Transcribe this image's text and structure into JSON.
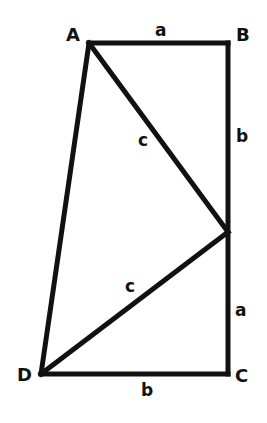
{
  "diagram": {
    "type": "geometry-figure",
    "colors": {
      "line": "#111111",
      "background": "#ffffff"
    },
    "vertices": {
      "A": {
        "label": "A",
        "x": 89,
        "y": 43
      },
      "B": {
        "label": "B",
        "x": 228,
        "y": 43
      },
      "E": {
        "label": "",
        "x": 228,
        "y": 232
      },
      "C": {
        "label": "C",
        "x": 228,
        "y": 374
      },
      "D": {
        "label": "D",
        "x": 41,
        "y": 374
      }
    },
    "edges": [
      {
        "from": "A",
        "to": "B",
        "label": "a"
      },
      {
        "from": "B",
        "to": "E",
        "label": "b"
      },
      {
        "from": "E",
        "to": "C",
        "label": "a"
      },
      {
        "from": "C",
        "to": "D",
        "label": "b"
      },
      {
        "from": "D",
        "to": "A",
        "label": ""
      },
      {
        "from": "A",
        "to": "E",
        "label": "c"
      },
      {
        "from": "D",
        "to": "E",
        "label": "c"
      }
    ],
    "labels": {
      "vertex_a": "A",
      "vertex_b": "B",
      "vertex_c": "C",
      "vertex_d": "D",
      "side_ab": "a",
      "side_be": "b",
      "side_ec": "a",
      "side_cd": "b",
      "side_ae": "c",
      "side_de": "c"
    }
  }
}
